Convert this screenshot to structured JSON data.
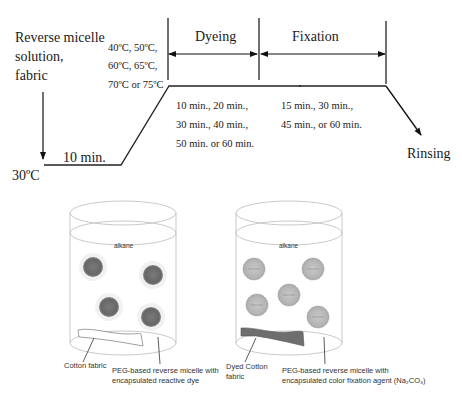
{
  "process": {
    "start_label": [
      "Reverse micelle",
      "solution,",
      "fabric"
    ],
    "start_temp": "30ºC",
    "ramp_time": "10 min.",
    "temps": [
      "40ºC, 50ºC,",
      "60ºC, 65ºC,",
      "70ºC or 75ºC"
    ],
    "phases": [
      {
        "name": "Dyeing",
        "times": [
          "10 min., 20 min.,",
          "30 min., 40 min.,",
          "50 min. or 60 min."
        ]
      },
      {
        "name": "Fixation",
        "times": [
          "15 min., 30 min.,",
          "45 min., or 60 min."
        ]
      }
    ],
    "end_label": "Rinsing"
  },
  "beakers": [
    {
      "medium": "alkane",
      "fabric_label": "Cotton fabric",
      "micelle_label": [
        "PEG-based reverse micelle with",
        "encapsulated reactive dye"
      ],
      "micelle_color": "#707070",
      "fabric_color": "#ffffff"
    },
    {
      "medium": "alkane",
      "fabric_label": [
        "Dyed Cotton",
        "fabric"
      ],
      "micelle_label": [
        "PEG-based reverse micelle with",
        "encapsulated color fixation agent (Na₂CO₃)"
      ],
      "micelle_color": "#b8b8b8",
      "fabric_color": "#6e6e6e"
    }
  ]
}
